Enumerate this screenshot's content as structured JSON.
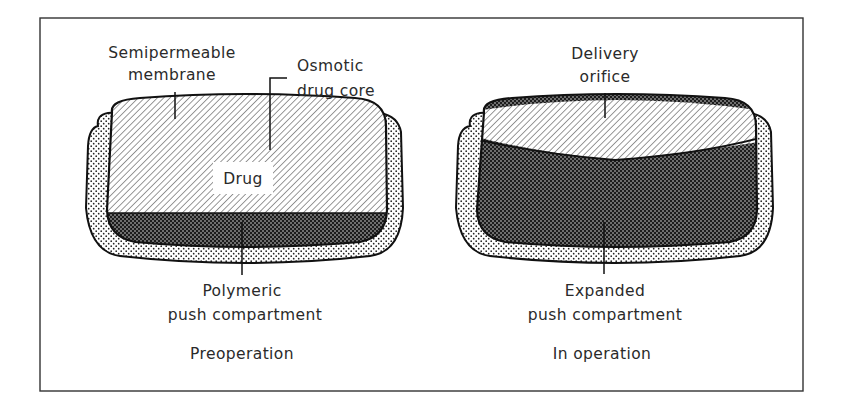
{
  "figure": {
    "type": "osmotic-pump-tablet-diagram",
    "panels": [
      {
        "id": "preoperation",
        "caption": "Preoperation",
        "labels": {
          "membrane_line1": "Semipermeable",
          "membrane_line2": "membrane",
          "core_line1": "Osmotic",
          "core_line2": "drug core",
          "drug": "Drug",
          "push_line1": "Polymeric",
          "push_line2": "push compartment"
        }
      },
      {
        "id": "in-operation",
        "caption": "In operation",
        "labels": {
          "orifice_line1": "Delivery",
          "orifice_line2": "orifice",
          "push_line1": "Expanded",
          "push_line2": "push compartment"
        }
      }
    ],
    "colors": {
      "ink": "#1a1a1a",
      "background": "#ffffff",
      "frame": "#333333"
    }
  }
}
